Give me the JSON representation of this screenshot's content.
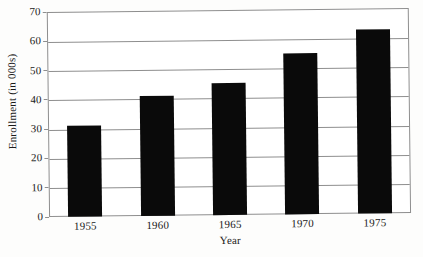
{
  "chart_data": {
    "type": "bar",
    "title": "",
    "subtitle": "",
    "categories": [
      "1955",
      "1960",
      "1965",
      "1970",
      "1975"
    ],
    "values": [
      31,
      41,
      45,
      55,
      63
    ],
    "xlabel": "Year",
    "ylabel": "Enrollment (in 000s)",
    "ylim": [
      0,
      70
    ],
    "ytick_labels": [
      "0",
      "10",
      "20",
      "30",
      "40",
      "50",
      "60",
      "70"
    ],
    "ytick_values": [
      0,
      10,
      20,
      30,
      40,
      50,
      60,
      70
    ],
    "grid": "horizontal",
    "legend": "none",
    "bar_color": "#0a0a0a",
    "grid_color": "#8e8e8e",
    "background_color": "#ffffff",
    "annotations": []
  }
}
